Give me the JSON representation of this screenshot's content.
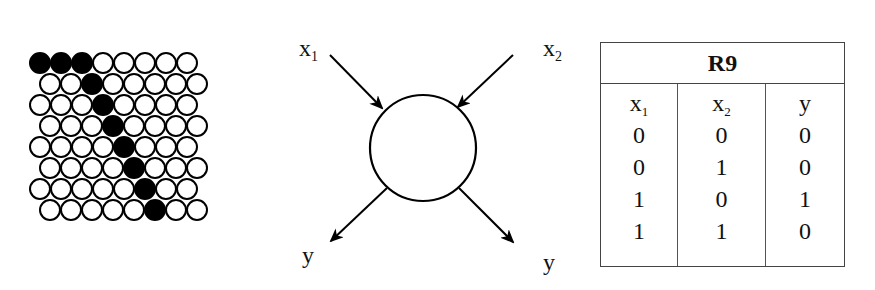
{
  "figure": {
    "grid": {
      "rows": 8,
      "cols_per_row": 8,
      "circle_radius": 10,
      "pitch": 21,
      "row_height": 21,
      "origin_x": 40,
      "origin_y": 63,
      "odd_row_offset": 10,
      "filled": [
        [
          0,
          0
        ],
        [
          0,
          1
        ],
        [
          0,
          2
        ],
        [
          1,
          2
        ],
        [
          2,
          3
        ],
        [
          3,
          3
        ],
        [
          4,
          4
        ],
        [
          5,
          4
        ],
        [
          6,
          5
        ],
        [
          7,
          5
        ]
      ],
      "fill_color": "#000000",
      "empty_color": "#ffffff",
      "stroke_color": "#000000"
    },
    "neuron": {
      "center_x": 423,
      "center_y": 148,
      "radius": 53,
      "input_labels": [
        {
          "base": "x",
          "sub": "1"
        },
        {
          "base": "x",
          "sub": "2"
        }
      ],
      "output_labels": [
        "y",
        "y"
      ]
    },
    "truth_table": {
      "title": "R9",
      "headers": [
        {
          "base": "x",
          "sub": "1"
        },
        {
          "base": "x",
          "sub": "2"
        },
        {
          "base": "y",
          "sub": ""
        }
      ],
      "rows": [
        [
          "0",
          "0",
          "0"
        ],
        [
          "0",
          "1",
          "0"
        ],
        [
          "1",
          "0",
          "1"
        ],
        [
          "1",
          "1",
          "0"
        ]
      ]
    }
  }
}
